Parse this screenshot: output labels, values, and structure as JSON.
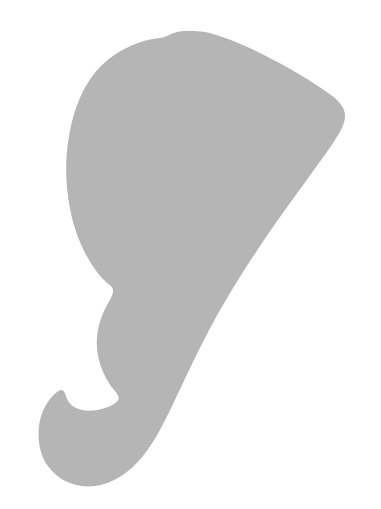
{
  "image": {
    "kind": "silhouette-illustration",
    "subject_label": "elephant-head-silhouette",
    "width": 381,
    "height": 509,
    "background_color": "#ffffff",
    "shape_fill_color": "#b5b5b5",
    "stroke": "none",
    "visible_text": "",
    "description": "Solid flat gray silhouette resembling an elephant head seen from the side, with a broad fan-shaped ear at the top right, a rounded crown, and a long trunk curving down to the lower left ending in a hooked curl."
  },
  "shape": {
    "name": "elephant-head-silhouette",
    "fill": "#b5b5b5",
    "fill_rule": "nonzero",
    "path": "M 190 31 C 172 30 169 37 160 38 C 140 40 118 49 101 66 C 85 82 74 106 69 136 C 64 164 66 192 72 218 C 80 249 94 270 105 281 C 110 286 113 286 113 291 C 113 296 109 301 105 309 C 99 321 96 334 97 348 C 98 364 106 381 115 391 C 120 397 120 400 114 404 C 106 409 93 412 82 410 C 73 408 68 403 66 396 C 64 390 62 388 57 392 C 48 399 41 411 39 426 C 37 443 41 460 52 471 C 63 483 80 488 95 486 C 113 484 130 472 143 456 C 155 441 164 423 173 404 C 184 381 194 359 206 336 C 222 305 241 274 262 243 C 285 209 310 176 331 146 C 339 134 345 125 345 116 C 345 108 340 102 331 95 C 312 81 286 66 262 54 C 240 43 220 35 205 32 C 199 31 194 31 190 31 Z"
  },
  "colors": {
    "background": "#ffffff",
    "silhouette": "#b5b5b5"
  }
}
